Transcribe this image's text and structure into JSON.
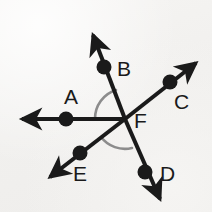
{
  "figure": {
    "background_color": "#f3f2f0",
    "ink_color": "#1a1a1a",
    "arc_color": "#8c8c8c",
    "vertex": {
      "name": "F",
      "x": 125,
      "y": 119
    },
    "labels": [
      {
        "name": "A",
        "text": "A",
        "x": 64,
        "y": 86
      },
      {
        "name": "B",
        "text": "B",
        "x": 117,
        "y": 58
      },
      {
        "name": "C",
        "text": "C",
        "x": 174,
        "y": 91
      },
      {
        "name": "D",
        "text": "D",
        "x": 160,
        "y": 163
      },
      {
        "name": "E",
        "text": "E",
        "x": 73,
        "y": 163
      },
      {
        "name": "F",
        "text": "F",
        "x": 134,
        "y": 110
      }
    ],
    "rays": [
      {
        "name": "ray-FA",
        "label": "A",
        "dot": {
          "x": 66,
          "y": 119
        },
        "tip": {
          "x": 15,
          "y": 119
        }
      },
      {
        "name": "ray-FB",
        "label": "B",
        "dot": {
          "x": 104,
          "y": 67
        },
        "tip": {
          "x": 89,
          "y": 27
        }
      },
      {
        "name": "ray-FC",
        "label": "C",
        "dot": {
          "x": 170,
          "y": 82
        },
        "tip": {
          "x": 202,
          "y": 59
        }
      },
      {
        "name": "ray-FD",
        "label": "D",
        "dot": {
          "x": 145,
          "y": 172
        },
        "tip": {
          "x": 163,
          "y": 207
        }
      },
      {
        "name": "ray-FE",
        "label": "E",
        "dot": {
          "x": 80,
          "y": 153
        },
        "tip": {
          "x": 43,
          "y": 182
        }
      }
    ],
    "angle_arcs": [
      {
        "name": "angle-arc-AFB",
        "from": "A",
        "to": "B",
        "radius": 30
      },
      {
        "name": "angle-arc-EFD",
        "from": "E",
        "to": "D",
        "radius": 30
      }
    ],
    "dot_radius": 7,
    "line_width": 4
  }
}
